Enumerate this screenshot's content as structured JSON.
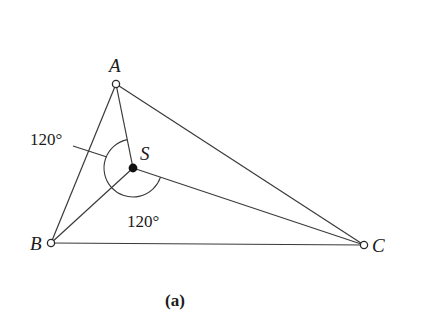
{
  "diagram": {
    "points": {
      "A": {
        "label": "A",
        "x": 116,
        "y": 84
      },
      "B": {
        "label": "B",
        "x": 51,
        "y": 243
      },
      "C": {
        "label": "C",
        "x": 364,
        "y": 245
      },
      "S": {
        "label": "S",
        "x": 133,
        "y": 168
      }
    },
    "angles": [
      {
        "label": "120°",
        "between": [
          "SA",
          "SB"
        ]
      },
      {
        "label": "120°",
        "between": [
          "SB",
          "SC"
        ]
      }
    ],
    "caption": "(a)",
    "colors": {
      "line": "#3a3a3a",
      "dot": "#111111",
      "background": "#ffffff"
    }
  }
}
